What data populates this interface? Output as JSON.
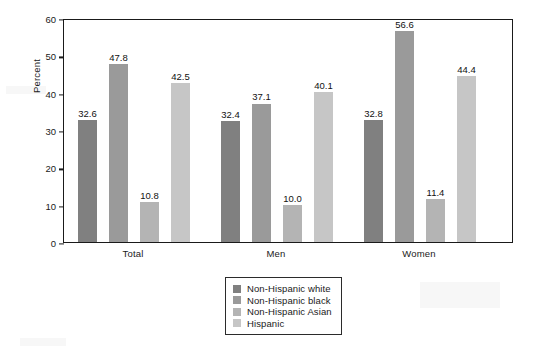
{
  "chart_data": {
    "type": "bar",
    "title": "",
    "subtitle": "",
    "xlabel": "",
    "ylabel": "Percent",
    "categories": [
      "Total",
      "Men",
      "Women"
    ],
    "series": [
      {
        "name": "Non-Hispanic white",
        "color": "#808080",
        "values": [
          32.6,
          32.4,
          32.8
        ],
        "labels": [
          "32.6",
          "32.4",
          "32.8"
        ]
      },
      {
        "name": "Non-Hispanic black",
        "color": "#9a9a9a",
        "values": [
          47.8,
          37.1,
          56.6
        ],
        "labels": [
          "47.8",
          "37.1",
          "56.6"
        ]
      },
      {
        "name": "Non-Hispanic Asian",
        "color": "#b4b4b4",
        "values": [
          10.8,
          10.0,
          11.4
        ],
        "labels": [
          "10.8",
          "10.0",
          "11.4"
        ]
      },
      {
        "name": "Hispanic",
        "color": "#c6c6c6",
        "values": [
          42.5,
          40.1,
          44.4
        ],
        "labels": [
          "42.5",
          "40.1",
          "44.4"
        ]
      }
    ],
    "ylim": [
      0,
      60
    ],
    "ytick_step": 10,
    "yticks": [
      "0",
      "10",
      "20",
      "30",
      "40",
      "50",
      "60"
    ],
    "grid": false,
    "legend_position": "bottom-center",
    "legend_entries": [
      "Non-Hispanic white",
      "Non-Hispanic black",
      "Non-Hispanic Asian",
      "Hispanic"
    ]
  },
  "axes": {
    "y_title": "Percent",
    "y_ticks": [
      "60",
      "50",
      "40",
      "30",
      "20",
      "10",
      "0"
    ],
    "x_ticks": [
      "Total",
      "Men",
      "Women"
    ]
  },
  "legend": {
    "items": [
      {
        "label": "Non-Hispanic white",
        "color": "#808080"
      },
      {
        "label": "Non-Hispanic black",
        "color": "#9a9a9a"
      },
      {
        "label": "Non-Hispanic Asian",
        "color": "#b4b4b4"
      },
      {
        "label": "Hispanic",
        "color": "#c6c6c6"
      }
    ]
  },
  "page": {
    "mark": ""
  }
}
